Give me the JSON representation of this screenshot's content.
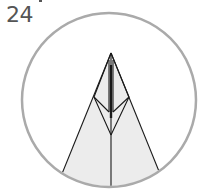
{
  "step": {
    "number": "24"
  },
  "diagram": {
    "type": "origami-fold-step",
    "circle": {
      "cx": 109,
      "cy": 100,
      "r": 87,
      "stroke": "#aaaaaa"
    },
    "paper_fill": "#ececec",
    "line_color": "#1a1a1a"
  }
}
